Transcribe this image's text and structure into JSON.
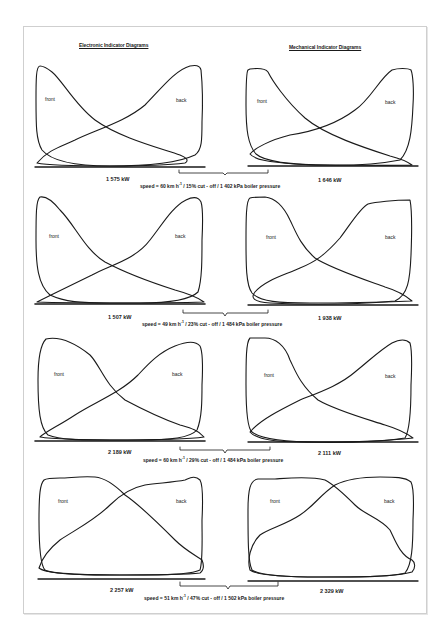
{
  "document": {
    "headers": {
      "left": "Electronic Indicator Diagrams",
      "right": "Mechanical Indicator Diagrams"
    },
    "rows": [
      {
        "electronic": {
          "front_label": "front",
          "back_label": "back",
          "power": "1 575 kW"
        },
        "mechanical": {
          "front_label": "front",
          "back_label": "back",
          "power": "1 646 kW"
        },
        "caption_pre": "speed = 60 km h",
        "caption_sup": "-1",
        "caption_post": " / 15% cut - off / 1 402 kPa boiler pressure"
      },
      {
        "electronic": {
          "front_label": "front",
          "back_label": "back",
          "power": "1 507 kW"
        },
        "mechanical": {
          "front_label": "front",
          "back_label": "back",
          "power": "1 938 kW"
        },
        "caption_pre": "speed = 49 km h",
        "caption_sup": "-1",
        "caption_post": " / 23% cut - off / 1 484 kPa boiler pressure"
      },
      {
        "electronic": {
          "front_label": "front",
          "back_label": "back",
          "power": "2 189 kW"
        },
        "mechanical": {
          "front_label": "front",
          "back_label": "back",
          "power": "2 111 kW"
        },
        "caption_pre": "speed = 60 km h",
        "caption_sup": "-1",
        "caption_post": " / 29% cut - off / 1 484 kPa boiler pressure"
      },
      {
        "electronic": {
          "front_label": "front",
          "back_label": "back",
          "power": "2 257 kW"
        },
        "mechanical": {
          "front_label": "front",
          "back_label": "back",
          "power": "2 329 kW"
        },
        "caption_pre": "speed = 51 km h",
        "caption_sup": "-1",
        "caption_post": " / 47% cut - off / 1 502 kPa boiler pressure"
      }
    ]
  },
  "colors": {
    "ink": "#1a1a1a",
    "frame": "#cfcfcf",
    "background": "#ffffff"
  }
}
